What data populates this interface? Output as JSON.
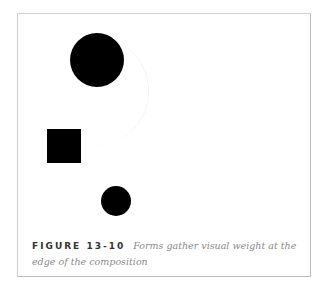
{
  "figure": {
    "label": "FIGURE 13-10",
    "caption": "Forms gather visual weight at the edge of the composition",
    "shapes": [
      {
        "type": "circle",
        "role": "large-circle",
        "cx": 97,
        "cy": 60,
        "r": 27,
        "color": "#000000"
      },
      {
        "type": "square",
        "role": "square",
        "x": 47,
        "y": 129,
        "size": 34,
        "color": "#000000"
      },
      {
        "type": "circle",
        "role": "small-circle",
        "cx": 116,
        "cy": 201,
        "r": 15,
        "color": "#000000"
      }
    ],
    "frame_border_color": "#cfcfcf"
  }
}
